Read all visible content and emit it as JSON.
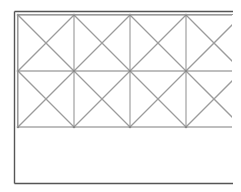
{
  "diagram": {
    "type": "crossed-grid-lattice",
    "background": "#ffffff",
    "frame": {
      "outer": {
        "x1": 14.5,
        "y1": 11.5,
        "x2": 233,
        "y2": 183.5,
        "color": "#555555",
        "width": 1.4
      },
      "inner": {
        "x1": 17.5,
        "y1": 14.5,
        "x2": 233,
        "color": "#9a9a9a",
        "width": 1
      }
    },
    "grid": {
      "x_lines": [
        18,
        74,
        130,
        186
      ],
      "x_end": 232,
      "y_lines": [
        15,
        71,
        127
      ],
      "cell_size": 56,
      "line_color": "#a8a8a8",
      "diag_color": "#9c9c9c",
      "line_width": 1.3,
      "node_color": "#888888"
    },
    "empty_region": {
      "y_top": 127,
      "y_bottom": 183
    }
  }
}
